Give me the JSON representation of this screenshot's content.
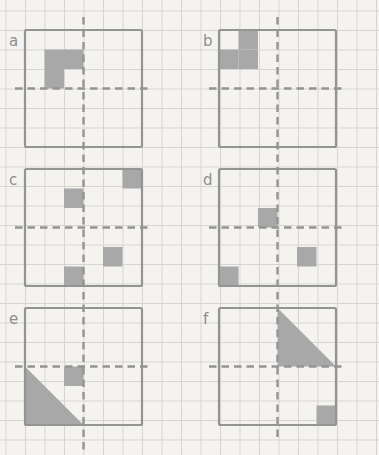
{
  "paper": {
    "background_color": "#f5f3ef",
    "grid_line_color": "#d7d5d2",
    "grid_cell_px": 19.5,
    "grid_offset_x": 5.5,
    "grid_offset_y": 10.5,
    "width_px": 379,
    "height_px": 455
  },
  "style": {
    "shade_color": "#a8a8a8",
    "line_color": "#949494",
    "label_color": "#8e8e8e",
    "outline_width": 2.2,
    "dash_width": 2.4,
    "dash_pattern": "7.5 5"
  },
  "layout": {
    "square_px": 117,
    "cell_px": 19.5,
    "grid_cols": 6,
    "grid_rows": 6,
    "column_lefts": [
      25,
      219
    ],
    "row_tops": [
      30,
      169,
      308
    ],
    "label_dx": -16,
    "label_dy": 16,
    "h_mirror_overhang_left": 10,
    "h_mirror_overhang_right": 8,
    "vertical_mirror_lines": [
      {
        "x": 83.5,
        "y1": 17,
        "y2": 452
      },
      {
        "x": 277.5,
        "y1": 17,
        "y2": 440
      }
    ]
  },
  "panels": [
    {
      "label": "a",
      "column": 0,
      "row": 0,
      "shaded_cells": [
        [
          1,
          1
        ],
        [
          2,
          1
        ],
        [
          1,
          2
        ]
      ],
      "shaded_triangles": []
    },
    {
      "label": "b",
      "column": 1,
      "row": 0,
      "shaded_cells": [
        [
          1,
          0
        ],
        [
          0,
          1
        ],
        [
          1,
          1
        ]
      ],
      "shaded_triangles": []
    },
    {
      "label": "c",
      "column": 0,
      "row": 1,
      "shaded_cells": [
        [
          5,
          0
        ],
        [
          2,
          1
        ],
        [
          4,
          4
        ],
        [
          2,
          5
        ]
      ],
      "shaded_triangles": []
    },
    {
      "label": "d",
      "column": 1,
      "row": 1,
      "shaded_cells": [
        [
          2,
          2
        ],
        [
          4,
          4
        ],
        [
          0,
          5
        ]
      ],
      "shaded_triangles": []
    },
    {
      "label": "e",
      "column": 0,
      "row": 2,
      "shaded_cells": [
        [
          2,
          3
        ]
      ],
      "shaded_triangles": [
        [
          [
            0,
            3
          ],
          [
            0,
            6
          ],
          [
            3,
            6
          ]
        ]
      ]
    },
    {
      "label": "f",
      "column": 1,
      "row": 2,
      "shaded_cells": [
        [
          5,
          5
        ]
      ],
      "shaded_triangles": [
        [
          [
            3,
            0
          ],
          [
            3,
            3
          ],
          [
            6,
            3
          ]
        ]
      ]
    }
  ]
}
